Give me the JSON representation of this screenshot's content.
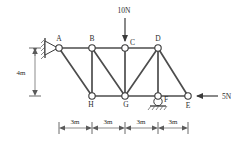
{
  "figure": {
    "colors": {
      "member": "#4d4d4d",
      "node_stroke": "#3a3a3a",
      "node_fill": "#ffffff",
      "text": "#2b2b2b",
      "dimension": "#5a5a5a",
      "background": "#ffffff"
    }
  },
  "nodes": [
    {
      "id": "A",
      "label": "A",
      "x": 59,
      "y": 48,
      "label_dx": 0,
      "label_dy": -5
    },
    {
      "id": "B",
      "label": "B",
      "x": 92,
      "y": 48,
      "label_dx": 0,
      "label_dy": -5
    },
    {
      "id": "C",
      "label": "C",
      "x": 125,
      "y": 48,
      "label_dx": 5,
      "label_dy": -1
    },
    {
      "id": "D",
      "label": "D",
      "x": 158,
      "y": 48,
      "label_dx": 0,
      "label_dy": -5
    },
    {
      "id": "E",
      "label": "E",
      "x": 188,
      "y": 96,
      "label_dx": 0,
      "label_dy": 10
    },
    {
      "id": "F",
      "label": "F",
      "x": 158,
      "y": 96,
      "label_dx": 6,
      "label_dy": 5
    },
    {
      "id": "G",
      "label": "G",
      "x": 125,
      "y": 96,
      "label_dx": 1,
      "label_dy": 10
    },
    {
      "id": "H",
      "label": "H",
      "x": 92,
      "y": 96,
      "label_dx": -1,
      "label_dy": 10
    }
  ],
  "members": [
    {
      "from": "A",
      "to": "B",
      "name": "member-AB"
    },
    {
      "from": "B",
      "to": "C",
      "name": "member-BC"
    },
    {
      "from": "C",
      "to": "D",
      "name": "member-CD"
    },
    {
      "from": "H",
      "to": "G",
      "name": "member-HG"
    },
    {
      "from": "G",
      "to": "F",
      "name": "member-GF"
    },
    {
      "from": "F",
      "to": "E",
      "name": "member-FE"
    },
    {
      "from": "A",
      "to": "H",
      "name": "member-AH"
    },
    {
      "from": "B",
      "to": "H",
      "name": "member-BH"
    },
    {
      "from": "B",
      "to": "G",
      "name": "member-BG"
    },
    {
      "from": "C",
      "to": "G",
      "name": "member-CG"
    },
    {
      "from": "D",
      "to": "G",
      "name": "member-DG"
    },
    {
      "from": "D",
      "to": "F",
      "name": "member-DF"
    },
    {
      "from": "D",
      "to": "E",
      "name": "member-DE"
    }
  ],
  "loads": [
    {
      "id": "load-10N",
      "label": "10N",
      "magnitude": 10,
      "unit": "N",
      "at_node": "C",
      "direction": "down",
      "label_x": 124,
      "label_y": 12,
      "tail_x": 125,
      "tail_y": 18,
      "tip_x": 125,
      "tip_y": 43
    },
    {
      "id": "load-5N",
      "label": "5N",
      "magnitude": 5,
      "unit": "N",
      "at_node": "E",
      "direction": "left",
      "label_x": 222,
      "label_y": 99,
      "tail_x": 218,
      "tail_y": 96,
      "tip_x": 194,
      "tip_y": 96
    }
  ],
  "supports": [
    {
      "id": "support-pin-A",
      "type": "pin",
      "at_node": "A",
      "description": "pinned support against hatched wall"
    },
    {
      "id": "support-roller-F",
      "type": "roller",
      "at_node": "F",
      "description": "roller support on hatched ground"
    }
  ],
  "dimensions": {
    "vertical": {
      "id": "dimension-height",
      "label": "4m",
      "value": 4,
      "unit": "m",
      "label_x": 21,
      "label_y": 74,
      "line_x": 35,
      "top_y": 48,
      "bottom_y": 96
    },
    "horizontal": {
      "id": "dimension-spans",
      "line_y": 128,
      "ticks": [
        59,
        92,
        125,
        158,
        188
      ],
      "segments": [
        {
          "label": "3m",
          "value": 3,
          "unit": "m",
          "from_x": 59,
          "to_x": 92,
          "mid_x": 75
        },
        {
          "label": "3m",
          "value": 3,
          "unit": "m",
          "from_x": 92,
          "to_x": 125,
          "mid_x": 108
        },
        {
          "label": "3m",
          "value": 3,
          "unit": "m",
          "from_x": 125,
          "to_x": 158,
          "mid_x": 141
        },
        {
          "label": "3m",
          "value": 3,
          "unit": "m",
          "from_x": 158,
          "to_x": 188,
          "mid_x": 173
        }
      ]
    }
  }
}
